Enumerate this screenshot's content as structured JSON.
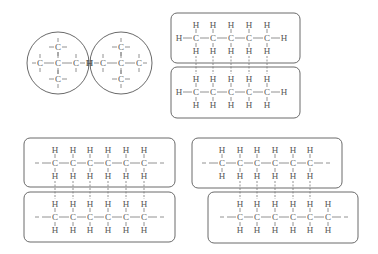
{
  "diagram": {
    "title": "",
    "colors": {
      "stroke": "#6a6a6a",
      "text": "#555555",
      "background": "#ffffff"
    },
    "branched_molecules": {
      "label": "branched alkane molecules (spherical shape)",
      "circles": [
        {
          "cx": 58,
          "cy": 63,
          "r": 31,
          "end": "right"
        },
        {
          "cx": 121,
          "cy": 63,
          "r": 31,
          "end": "left"
        }
      ],
      "atoms": {
        "carbon": "C",
        "hydrogen": "H"
      }
    },
    "pentane_pair": {
      "label": "straight-chain pentane molecules with intermolecular attractions",
      "boxes": [
        {
          "x": 171,
          "y": 13,
          "w": 129,
          "h": 50,
          "row_y": 38
        },
        {
          "x": 171,
          "y": 67,
          "w": 129,
          "h": 51,
          "row_y": 92
        }
      ],
      "carbon_x": [
        196,
        213,
        231,
        249,
        267
      ],
      "left_end": "H",
      "right_end": "H"
    },
    "long_chain_aligned": {
      "label": "long chains aligned",
      "boxes": [
        {
          "x": 24,
          "y": 138,
          "w": 151,
          "h": 49,
          "row_y": 163
        },
        {
          "x": 24,
          "y": 192,
          "w": 151,
          "h": 50,
          "row_y": 217
        }
      ],
      "carbon_x": [
        55,
        73,
        90,
        108,
        126,
        144
      ],
      "ends": "- -"
    },
    "long_chain_offset": {
      "label": "long chains offset",
      "boxes": [
        {
          "x": 192,
          "y": 138,
          "w": 150,
          "h": 50,
          "row_y": 163,
          "carbon_x": [
            222,
            240,
            257,
            275,
            293,
            310
          ]
        },
        {
          "x": 208,
          "y": 192,
          "w": 150,
          "h": 51,
          "row_y": 217,
          "carbon_x": [
            240,
            257,
            275,
            293,
            310,
            328
          ]
        }
      ],
      "attraction_x": [
        240,
        257,
        275,
        293,
        310
      ],
      "ends": "- -"
    }
  }
}
